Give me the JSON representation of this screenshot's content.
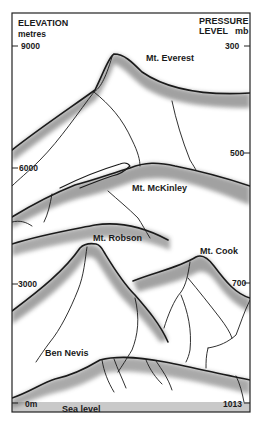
{
  "left_axis": {
    "title": "ELEVATION",
    "unit": "metres",
    "ticks": [
      {
        "label": "9000",
        "value": 9000
      },
      {
        "label": "6000",
        "value": 6000
      },
      {
        "label": "3000",
        "value": 3000
      },
      {
        "label": "0m",
        "value": 0
      }
    ]
  },
  "right_axis": {
    "title": "PRESSURE",
    "title_line2": "LEVEL",
    "unit": "mb",
    "ticks": [
      {
        "label": "300",
        "value": 300
      },
      {
        "label": "500",
        "value": 500
      },
      {
        "label": "700",
        "value": 700
      },
      {
        "label": "1013",
        "value": 1013
      }
    ]
  },
  "peaks": [
    {
      "name": "Mt. Everest"
    },
    {
      "name": "Mt. McKinley"
    },
    {
      "name": "Mt. Robson"
    },
    {
      "name": "Mt. Cook"
    },
    {
      "name": "Ben Nevis"
    }
  ],
  "sea_level": {
    "label": "Sea level"
  },
  "colors": {
    "frame": "#222222",
    "ridge": "#1a1a1a",
    "shade": "#555555",
    "sea": "#c8c8c8",
    "background": "#ffffff"
  }
}
